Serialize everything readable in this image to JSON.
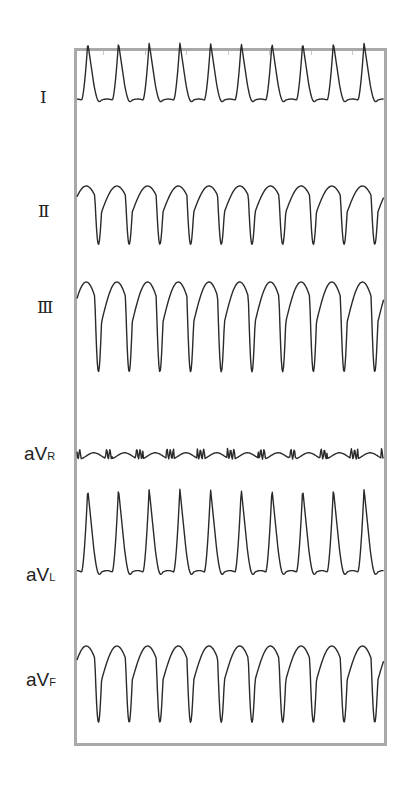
{
  "chart_data": {
    "type": "line",
    "title": "",
    "xlabel": "",
    "ylabel": "",
    "grid": false,
    "leads": [
      {
        "id": "I",
        "label": "I",
        "sub": "",
        "baseline_y": 100,
        "amplitude": 22,
        "shape": "upright_peak",
        "beats": 10
      },
      {
        "id": "II",
        "label": "II",
        "sub": "",
        "baseline_y": 212,
        "amplitude": 26,
        "shape": "inverted_deep",
        "beats": 10
      },
      {
        "id": "III",
        "label": "III",
        "sub": "",
        "baseline_y": 322,
        "amplitude": 40,
        "shape": "inverted_deep",
        "beats": 10
      },
      {
        "id": "aVR",
        "label": "aV",
        "sub": "R",
        "baseline_y": 456,
        "amplitude": 4,
        "shape": "low_noise",
        "beats": 10
      },
      {
        "id": "aVL",
        "label": "aV",
        "sub": "L",
        "baseline_y": 572,
        "amplitude": 32,
        "shape": "upright_peak",
        "beats": 10
      },
      {
        "id": "aVF",
        "label": "aV",
        "sub": "F",
        "baseline_y": 680,
        "amplitude": 34,
        "shape": "inverted_deep",
        "beats": 10
      }
    ],
    "x_range": [
      77,
      384
    ],
    "top_ticks_x": [
      103,
      145,
      186,
      228,
      269,
      311,
      352
    ]
  },
  "labels": {
    "I": "Ⅰ",
    "II": "Ⅱ",
    "III": "Ⅲ",
    "aVR": {
      "main": "aV",
      "sub": "R"
    },
    "aVL": {
      "main": "aV",
      "sub": "L"
    },
    "aVF": {
      "main": "aV",
      "sub": "F"
    }
  },
  "colors": {
    "trace": "#2a2a2a",
    "frame": "#a9a9a9",
    "label": "#222222",
    "background": "#ffffff"
  }
}
